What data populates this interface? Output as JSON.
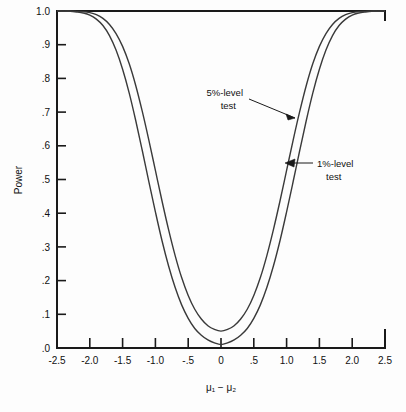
{
  "chart_data": {
    "type": "line",
    "title": "",
    "xlabel": "μ₁ − μ₂",
    "ylabel": "Power",
    "xlim": [
      -2.5,
      2.5
    ],
    "ylim": [
      0.0,
      1.0
    ],
    "grid": false,
    "legend_position": "inline-annotations",
    "xticks": [
      -2.5,
      -2.0,
      -1.5,
      -1.0,
      -0.5,
      0,
      0.5,
      1.0,
      1.5,
      2.0,
      2.5
    ],
    "xtick_labels": [
      "-2.5",
      "-2.0",
      "-1.5",
      "-1.0",
      "-.5",
      "0",
      ".5",
      "1.0",
      "1.5",
      "2.0",
      "2.5"
    ],
    "yticks": [
      0.0,
      0.1,
      0.2,
      0.3,
      0.4,
      0.5,
      0.6,
      0.7,
      0.8,
      0.9,
      1.0
    ],
    "ytick_labels": [
      ".0",
      ".1",
      ".2",
      ".3",
      ".4",
      ".5",
      ".6",
      ".7",
      ".8",
      ".9",
      "1.0"
    ],
    "annotations": [
      {
        "id": "anno-5pct",
        "line1": "5%-level",
        "line2": "test",
        "points_to_curve": "5%-level test"
      },
      {
        "id": "anno-1pct",
        "line1": "1%-level",
        "line2": "test",
        "points_to_curve": "1%-level test"
      }
    ],
    "series": [
      {
        "name": "5%-level test",
        "color": "#3a3a3a",
        "min_power": 0.05,
        "x": [
          -2.5,
          -2.4,
          -2.3,
          -2.2,
          -2.1,
          -2.0,
          -1.9,
          -1.8,
          -1.7,
          -1.6,
          -1.5,
          -1.4,
          -1.3,
          -1.2,
          -1.1,
          -1.0,
          -0.9,
          -0.8,
          -0.7,
          -0.6,
          -0.5,
          -0.4,
          -0.3,
          -0.2,
          -0.1,
          0.0,
          0.1,
          0.2,
          0.3,
          0.4,
          0.5,
          0.6,
          0.7,
          0.8,
          0.9,
          1.0,
          1.1,
          1.2,
          1.3,
          1.4,
          1.5,
          1.6,
          1.7,
          1.8,
          1.9,
          2.0,
          2.1,
          2.2,
          2.3,
          2.4,
          2.5
        ],
        "y": [
          1.0,
          1.0,
          1.0,
          0.999,
          0.998,
          0.995,
          0.989,
          0.978,
          0.96,
          0.933,
          0.895,
          0.844,
          0.779,
          0.702,
          0.617,
          0.527,
          0.437,
          0.352,
          0.275,
          0.209,
          0.156,
          0.115,
          0.086,
          0.066,
          0.055,
          0.05,
          0.055,
          0.066,
          0.086,
          0.115,
          0.156,
          0.209,
          0.275,
          0.352,
          0.437,
          0.527,
          0.617,
          0.702,
          0.779,
          0.844,
          0.895,
          0.933,
          0.96,
          0.978,
          0.989,
          0.995,
          0.998,
          0.999,
          1.0,
          1.0,
          1.0
        ]
      },
      {
        "name": "1%-level test",
        "color": "#3a3a3a",
        "min_power": 0.01,
        "x": [
          -2.5,
          -2.4,
          -2.3,
          -2.2,
          -2.1,
          -2.0,
          -1.9,
          -1.8,
          -1.7,
          -1.6,
          -1.5,
          -1.4,
          -1.3,
          -1.2,
          -1.1,
          -1.0,
          -0.9,
          -0.8,
          -0.7,
          -0.6,
          -0.5,
          -0.4,
          -0.3,
          -0.2,
          -0.1,
          0.0,
          0.1,
          0.2,
          0.3,
          0.4,
          0.5,
          0.6,
          0.7,
          0.8,
          0.9,
          1.0,
          1.1,
          1.2,
          1.3,
          1.4,
          1.5,
          1.6,
          1.7,
          1.8,
          1.9,
          2.0,
          2.1,
          2.2,
          2.3,
          2.4,
          2.5
        ],
        "y": [
          1.0,
          0.999,
          0.999,
          0.997,
          0.994,
          0.988,
          0.976,
          0.957,
          0.927,
          0.884,
          0.827,
          0.757,
          0.675,
          0.586,
          0.494,
          0.404,
          0.319,
          0.244,
          0.18,
          0.128,
          0.088,
          0.058,
          0.038,
          0.024,
          0.015,
          0.01,
          0.015,
          0.024,
          0.038,
          0.058,
          0.088,
          0.128,
          0.18,
          0.244,
          0.319,
          0.404,
          0.494,
          0.586,
          0.675,
          0.757,
          0.827,
          0.884,
          0.927,
          0.957,
          0.976,
          0.988,
          0.994,
          0.997,
          0.999,
          0.999,
          1.0
        ]
      }
    ]
  }
}
